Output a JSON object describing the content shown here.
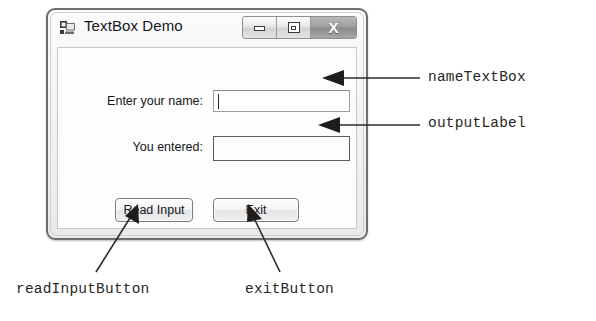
{
  "window": {
    "title": "TextBox Demo",
    "icon": "form-application-icon",
    "controls": {
      "minimize_label": "–",
      "maximize_label": "□",
      "close_label": "X"
    }
  },
  "form": {
    "name_label": "Enter your name:",
    "name_textbox_value": "",
    "output_label_caption": "You entered:",
    "output_label_value": "",
    "read_button_label": "Read Input",
    "exit_button_label": "Exit"
  },
  "annotations": {
    "name_textbox": "nameTextBox",
    "output_label": "outputLabel",
    "read_input_button": "readInputButton",
    "exit_button": "exitButton"
  },
  "colors": {
    "annotation_text": "#262626",
    "window_border": "#6e6e6e",
    "client_background": "#fdfdfd",
    "close_button": "#9c9c9c"
  }
}
